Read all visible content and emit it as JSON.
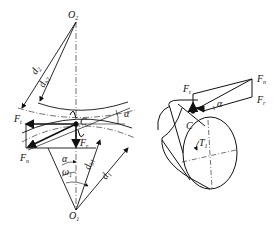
{
  "figure": {
    "left_diagram": {
      "description": "Spur gear meshing force analysis",
      "labels": {
        "O2": "O",
        "O2_sub": "2",
        "O1": "O",
        "O1_sub": "1",
        "d2": "d",
        "d2_sub": "2",
        "db2": "d",
        "db2_sub": "b2",
        "d1": "d",
        "d1_sub": "1",
        "db1": "d",
        "db1_sub": "b1",
        "C": "C",
        "alpha_top": "α",
        "alpha_mid": "α",
        "omega1": "ω",
        "omega1_sub": "1",
        "Ft": "F",
        "Ft_sub": "t",
        "Fr": "F",
        "Fr_sub": "r",
        "Fn": "F",
        "Fn_sub": "n"
      }
    },
    "right_diagram": {
      "description": "Force decomposition on gear cylinder",
      "labels": {
        "Ft": "F",
        "Ft_sub": "t",
        "Fn": "F",
        "Fn_sub": "n",
        "Fr": "F",
        "Fr_sub": "r",
        "alpha": "α",
        "C": "C",
        "T1": "T",
        "T1_sub": "1"
      }
    }
  }
}
